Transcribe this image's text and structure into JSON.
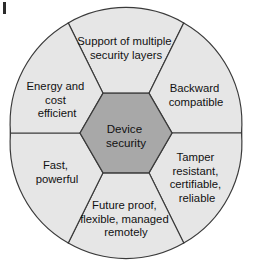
{
  "figure": {
    "name": "device-security-wheel",
    "shape": "circle-with-central-hexagon-and-six-segments",
    "background_color": "#ffffff",
    "circle_fill": "#ececec",
    "segment_fill": "#e6e6e6",
    "hexagon_fill": "#a8a8a8",
    "stroke_color": "#3a3a3a",
    "geometry": {
      "center_x": 126,
      "center_y": 133,
      "radius": 116,
      "hexagon_radius": 46
    },
    "artifact": {
      "name": "scan-edge-mark",
      "color": "#2b2b2b"
    }
  },
  "core": {
    "label": "Device security",
    "lines": [
      "Device",
      "security"
    ]
  },
  "segments": [
    {
      "id": "support-of-multiple-security-layers",
      "position": "top",
      "label": "Support of multiple security layers",
      "lines": [
        "Support of multiple",
        "security layers"
      ],
      "text_x": 126,
      "text_y": 45
    },
    {
      "id": "backward-compatible",
      "position": "top-right",
      "label": "Backward compatible",
      "lines": [
        "Backward",
        "compatible"
      ],
      "text_x": 196,
      "text_y": 92
    },
    {
      "id": "tamper-resistant-certifiable-reliable",
      "position": "bottom-right",
      "label": "Tamper resistant, certifiable, reliable",
      "lines": [
        "Tamper",
        "resistant,",
        "certifiable,",
        "reliable"
      ],
      "text_x": 197,
      "text_y": 161
    },
    {
      "id": "future-proof-flexible-managed-remotely",
      "position": "bottom",
      "label": "Future proof, flexible, managed remotely",
      "lines": [
        "Future proof,",
        "flexible, managed",
        "remotely"
      ],
      "text_x": 126,
      "text_y": 209
    },
    {
      "id": "fast-powerful",
      "position": "bottom-left",
      "label": "Fast, powerful",
      "lines": [
        "Fast,",
        "powerful"
      ],
      "text_x": 57,
      "text_y": 169
    },
    {
      "id": "energy-and-cost-efficient",
      "position": "top-left",
      "label": "Energy and cost efficient",
      "lines": [
        "Energy and",
        "cost",
        "efficient"
      ],
      "text_x": 57,
      "text_y": 90
    }
  ]
}
